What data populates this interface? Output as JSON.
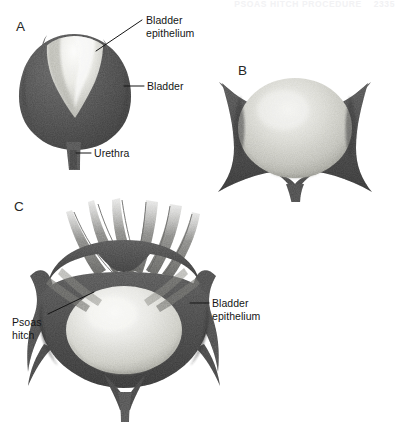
{
  "figure": {
    "kind": "medical-illustration",
    "background_color": "#ffffff",
    "ink_color": "#151515",
    "running_header": {
      "text": "PSOAS HITCH PROCEDURE",
      "page_number": "2335"
    },
    "panels": [
      {
        "id": "A",
        "letter": "A",
        "description": "Sagittal view of distended bladder with bladder epithelium and urethra"
      },
      {
        "id": "B",
        "letter": "B",
        "description": "Anterior view of bladder mobilized within surrounding tissue"
      },
      {
        "id": "C",
        "letter": "C",
        "description": "Bladder fixed to psoas muscle (psoas hitch) with bladder epithelium exposed"
      }
    ],
    "labels": {
      "a_epithelium": "Bladder\nepithelium",
      "a_bladder": "Bladder",
      "a_urethra": "Urethra",
      "c_epithelium": "Bladder\nepithelium",
      "c_psoas": "Psoas\nhitch"
    },
    "colors": {
      "muscle_dark": "#595959",
      "muscle_mid": "#7d7d7d",
      "epithelium_light": "#ededea",
      "epithelium_shadow": "#c9c9c4",
      "tissue_light": "#b8b8b4",
      "header_faint": "#f2f2f4"
    }
  }
}
